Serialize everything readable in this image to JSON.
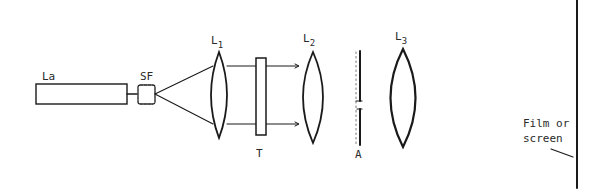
{
  "diagram": {
    "type": "optical-setup",
    "colors": {
      "ink": "#1a1a1a",
      "background": "#ffffff"
    },
    "components": {
      "laser": {
        "label": "La"
      },
      "spatial_filter": {
        "label": "SF"
      },
      "lens1": {
        "label": "L",
        "subscript": "1"
      },
      "transparency": {
        "label": "T"
      },
      "lens2": {
        "label": "L",
        "subscript": "2"
      },
      "aperture": {
        "label": "A"
      },
      "lens3": {
        "label": "L",
        "subscript": "3"
      },
      "screen": {
        "label_line1": "Film or",
        "label_line2": "screen"
      }
    }
  }
}
